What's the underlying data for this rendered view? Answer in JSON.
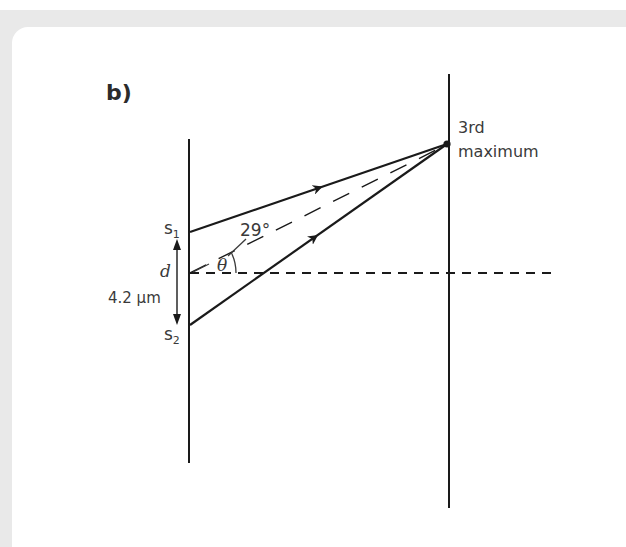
{
  "figure": {
    "part_label": "b)",
    "slit1_label": "s",
    "slit1_subscript": "1",
    "slit2_label": "s",
    "slit2_subscript": "2",
    "separation_symbol": "d",
    "separation_value": "4.2 μm",
    "angle_value": "29°",
    "angle_symbol": "θ",
    "screen_point_label_line1": "3rd",
    "screen_point_label_line2": "maximum"
  },
  "colors": {
    "ink": "#1a1a1a",
    "text": "#3a3a3a",
    "background_frame": "#e9e9e9",
    "panel": "#ffffff"
  }
}
